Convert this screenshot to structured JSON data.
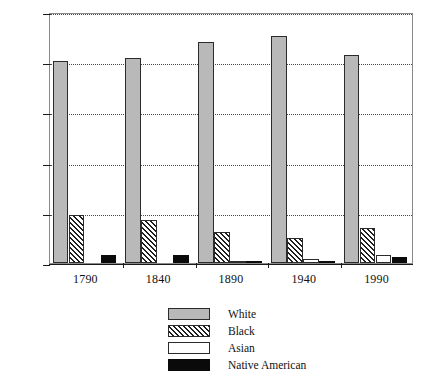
{
  "chart_data": {
    "type": "bar",
    "title": "",
    "xlabel": "",
    "ylabel": "Percent",
    "ylim": [
      0,
      100
    ],
    "yticks": [
      0,
      20,
      40,
      60,
      80,
      100
    ],
    "ytick_labels": [
      "0",
      "20%",
      "40%",
      "60%",
      "80%",
      "100%"
    ],
    "grid": true,
    "grid_style": "dotted-horizontal",
    "legend_position": "below-center",
    "categories": [
      "1790",
      "1840",
      "1890",
      "1940",
      "1990"
    ],
    "series": [
      {
        "name": "White",
        "values": [
          80.5,
          81.5,
          88.0,
          90.5,
          83.0
        ],
        "fill": "#b9b9b9",
        "pattern": "solid-gray"
      },
      {
        "name": "Black",
        "values": [
          19.0,
          17.0,
          12.5,
          10.0,
          14.0
        ],
        "fill": "#ffffff",
        "pattern": "diagonal-hatch"
      },
      {
        "name": "Asian",
        "values": [
          0.0,
          0.0,
          0.3,
          1.5,
          3.0
        ],
        "fill": "#ffffff",
        "pattern": "empty"
      },
      {
        "name": "Native American",
        "values": [
          3.0,
          3.0,
          1.0,
          0.8,
          2.5
        ],
        "fill": "#0a0a0a",
        "pattern": "solid-black"
      }
    ]
  },
  "legend": {
    "entries": [
      {
        "label": "White"
      },
      {
        "label": "Black"
      },
      {
        "label": "Asian"
      },
      {
        "label": "Native American"
      }
    ]
  }
}
